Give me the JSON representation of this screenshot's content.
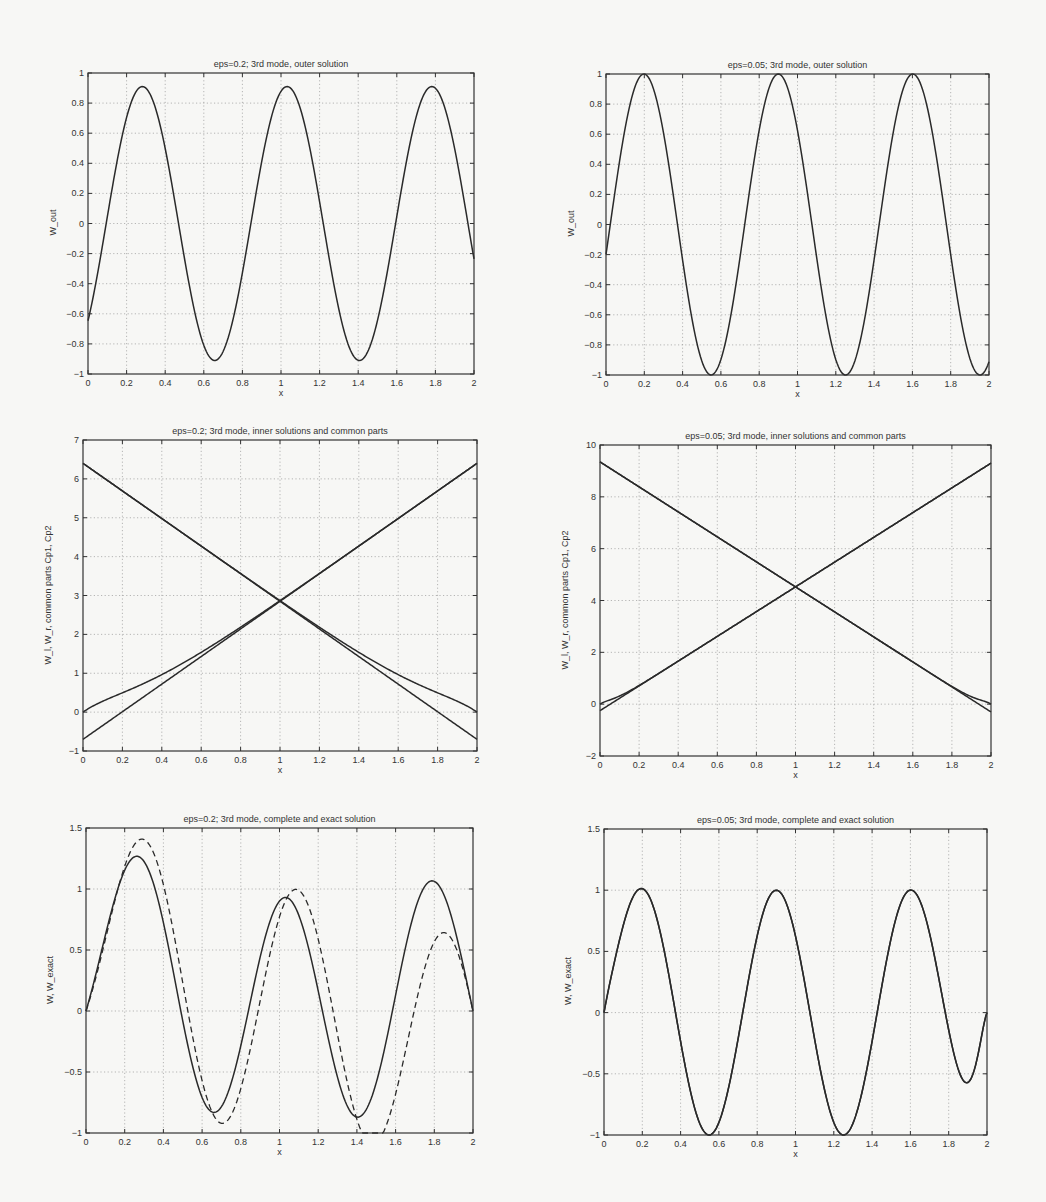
{
  "figure": {
    "panels": [
      {
        "id": "p1",
        "title": "eps=0.2;  3rd mode,  outer solution",
        "xlabel": "x",
        "ylabel": "W_out",
        "box": {
          "left": 88,
          "top": 73,
          "right": 474,
          "bottom": 374
        },
        "xlim": [
          0,
          2
        ],
        "ylim": [
          -1,
          1
        ],
        "xticks": [
          0,
          0.2,
          0.4,
          0.6,
          0.8,
          1,
          1.2,
          1.4,
          1.6,
          1.8,
          2
        ],
        "yticks": [
          -1,
          -0.8,
          -0.6,
          -0.4,
          -0.2,
          0,
          0.2,
          0.4,
          0.6,
          0.8,
          1
        ],
        "series": [
          {
            "name": "W_out",
            "style": "solid",
            "fn": "outer",
            "amp": 0.91,
            "k": 8.38,
            "phase": -0.79
          }
        ]
      },
      {
        "id": "p2",
        "title": "eps=0.05;  3rd mode,  outer solution",
        "xlabel": "x",
        "ylabel": "W_out",
        "box": {
          "left": 606,
          "top": 74,
          "right": 989,
          "bottom": 375
        },
        "xlim": [
          0,
          2
        ],
        "ylim": [
          -1,
          1
        ],
        "xticks": [
          0,
          0.2,
          0.4,
          0.6,
          0.8,
          1,
          1.2,
          1.4,
          1.6,
          1.8,
          2
        ],
        "yticks": [
          -1,
          -0.8,
          -0.6,
          -0.4,
          -0.2,
          0,
          0.2,
          0.4,
          0.6,
          0.8,
          1
        ],
        "series": [
          {
            "name": "W_out",
            "style": "solid",
            "fn": "outer",
            "amp": 1.0,
            "k": 8.95,
            "phase": -0.2
          }
        ]
      },
      {
        "id": "p3",
        "title": "eps=0.2;  3rd mode,  inner solutions and common parts",
        "xlabel": "x",
        "ylabel": "W_l, W_r, common parts Cp1, Cp2",
        "box": {
          "left": 83,
          "top": 440,
          "right": 477,
          "bottom": 751
        },
        "xlim": [
          0,
          2
        ],
        "ylim": [
          -1,
          7
        ],
        "xticks": [
          0,
          0.2,
          0.4,
          0.6,
          0.8,
          1,
          1.2,
          1.4,
          1.6,
          1.8,
          2
        ],
        "yticks": [
          -1,
          0,
          1,
          2,
          3,
          4,
          5,
          6,
          7
        ],
        "series": [
          {
            "name": "Cp1",
            "style": "solid",
            "fn": "line",
            "y0": -0.7,
            "y1": 6.4
          },
          {
            "name": "Cp2",
            "style": "solid",
            "fn": "line",
            "y0": 6.4,
            "y1": -0.7
          },
          {
            "name": "W_l",
            "style": "solid",
            "fn": "innerL",
            "y0": -0.7,
            "y1": 6.4,
            "decay": 0.2
          },
          {
            "name": "W_r",
            "style": "solid",
            "fn": "innerR",
            "y0": 6.4,
            "y1": -0.7,
            "decay": 0.2
          }
        ]
      },
      {
        "id": "p4",
        "title": "eps=0.05;  3rd mode,  inner solutions and common parts",
        "xlabel": "x",
        "ylabel": "W_l, W_r, common parts Cp1, Cp2",
        "box": {
          "left": 600,
          "top": 445,
          "right": 991,
          "bottom": 756
        },
        "xlim": [
          0,
          2
        ],
        "ylim": [
          -2,
          10
        ],
        "xticks": [
          0,
          0.2,
          0.4,
          0.6,
          0.8,
          1,
          1.2,
          1.4,
          1.6,
          1.8,
          2
        ],
        "yticks": [
          -2,
          0,
          2,
          4,
          6,
          8,
          10
        ],
        "series": [
          {
            "name": "Cp1",
            "style": "solid",
            "fn": "line",
            "y0": -0.25,
            "y1": 9.3
          },
          {
            "name": "Cp2",
            "style": "solid",
            "fn": "line",
            "y0": 9.35,
            "y1": -0.3
          },
          {
            "name": "W_l",
            "style": "solid",
            "fn": "innerL",
            "y0": -0.25,
            "y1": 9.3,
            "decay": 0.05
          },
          {
            "name": "W_r",
            "style": "solid",
            "fn": "innerR",
            "y0": 9.35,
            "y1": -0.3,
            "decay": 0.05
          }
        ]
      },
      {
        "id": "p5",
        "title": "eps=0.2;  3rd mode,  complete and exact solution",
        "xlabel": "x",
        "ylabel": "W, W_exact",
        "box": {
          "left": 86,
          "top": 828,
          "right": 473,
          "bottom": 1133
        },
        "xlim": [
          0,
          2
        ],
        "ylim": [
          -1,
          1.5
        ],
        "xticks": [
          0,
          0.2,
          0.4,
          0.6,
          0.8,
          1,
          1.2,
          1.4,
          1.6,
          1.8,
          2
        ],
        "yticks": [
          -1,
          -0.5,
          0,
          0.5,
          1,
          1.5
        ],
        "series": [
          {
            "name": "W",
            "style": "solid",
            "fn": "complete",
            "amp": 0.91,
            "k": 8.38,
            "phase": -0.79,
            "decay": 0.2,
            "peak": 1.0
          },
          {
            "name": "W_exact",
            "style": "dashed",
            "fn": "complete",
            "amp": 1.0,
            "k": 8.1,
            "phase": -0.95,
            "decay": 0.2,
            "peak": 1.03
          }
        ]
      },
      {
        "id": "p6",
        "title": "eps=0.05;  3rd mode,  complete and exact solution",
        "xlabel": "x",
        "ylabel": "W, W_exact",
        "box": {
          "left": 604,
          "top": 829,
          "right": 987,
          "bottom": 1135
        },
        "xlim": [
          0,
          2
        ],
        "ylim": [
          -1,
          1.5
        ],
        "xticks": [
          0,
          0.2,
          0.4,
          0.6,
          0.8,
          1,
          1.2,
          1.4,
          1.6,
          1.8,
          2
        ],
        "yticks": [
          -1,
          -0.5,
          0,
          0.5,
          1,
          1.5
        ],
        "series": [
          {
            "name": "W",
            "style": "solid",
            "fn": "complete",
            "amp": 1.0,
            "k": 8.95,
            "phase": -0.2,
            "decay": 0.05,
            "peak": 1.0
          },
          {
            "name": "W_exact",
            "style": "solid",
            "fn": "complete",
            "amp": 1.0,
            "k": 8.95,
            "phase": -0.2,
            "decay": 0.05,
            "peak": 1.0
          }
        ]
      }
    ]
  },
  "chart_data": [
    {
      "type": "line",
      "title": "eps=0.2;  3rd mode,  outer solution",
      "xlabel": "x",
      "ylabel": "W_out",
      "xlim": [
        0,
        2
      ],
      "ylim": [
        -1,
        1
      ],
      "grid": true,
      "x": [
        0,
        0.2,
        0.43,
        0.6,
        0.8,
        1.0,
        1.2,
        1.4,
        1.57,
        1.8,
        2.0
      ],
      "series": [
        {
          "name": "W_out",
          "values": [
            -0.7,
            0.2,
            0.91,
            0.55,
            -0.45,
            -0.91,
            -0.45,
            0.4,
            0.91,
            0.2,
            -0.7
          ]
        }
      ]
    },
    {
      "type": "line",
      "title": "eps=0.05;  3rd mode,  outer solution",
      "xlabel": "x",
      "ylabel": "W_out",
      "xlim": [
        0,
        2
      ],
      "ylim": [
        -1,
        1
      ],
      "grid": true,
      "x": [
        0,
        0.2,
        0.37,
        0.6,
        0.8,
        1.0,
        1.2,
        1.4,
        1.63,
        1.8,
        2.0
      ],
      "series": [
        {
          "name": "W_out",
          "values": [
            -0.2,
            0.7,
            1.0,
            0.4,
            -0.6,
            -1.0,
            -0.6,
            0.4,
            1.0,
            0.4,
            -0.22
          ]
        }
      ]
    },
    {
      "type": "line",
      "title": "eps=0.2;  3rd mode,  inner solutions and common parts",
      "xlabel": "x",
      "ylabel": "W_l, W_r, common parts Cp1, Cp2",
      "xlim": [
        0,
        2
      ],
      "ylim": [
        -1,
        7
      ],
      "grid": true,
      "x": [
        0,
        0.2,
        0.4,
        0.6,
        0.8,
        1.0,
        1.2,
        1.4,
        1.6,
        1.8,
        2.0
      ],
      "series": [
        {
          "name": "Cp1 (rising line)",
          "values": [
            -0.7,
            0.0,
            0.75,
            1.45,
            2.15,
            2.85,
            3.55,
            4.25,
            4.95,
            5.7,
            6.4
          ]
        },
        {
          "name": "Cp2 (falling line)",
          "values": [
            6.4,
            5.7,
            4.95,
            4.25,
            3.55,
            2.85,
            2.15,
            1.45,
            0.75,
            0.0,
            -0.7
          ]
        },
        {
          "name": "W_l (inner, left)",
          "values": [
            0.0,
            0.25,
            0.8,
            1.5,
            2.17,
            2.87,
            3.55,
            4.25,
            4.95,
            5.7,
            6.4
          ]
        },
        {
          "name": "W_r (inner, right)",
          "values": [
            6.4,
            5.7,
            4.95,
            4.25,
            3.55,
            2.87,
            2.17,
            1.5,
            0.8,
            0.25,
            0.0
          ]
        }
      ]
    },
    {
      "type": "line",
      "title": "eps=0.05;  3rd mode,  inner solutions and common parts",
      "xlabel": "x",
      "ylabel": "W_l, W_r, common parts Cp1, Cp2",
      "xlim": [
        0,
        2
      ],
      "ylim": [
        -2,
        10
      ],
      "grid": true,
      "x": [
        0,
        0.2,
        0.4,
        0.6,
        0.8,
        1.0,
        1.2,
        1.4,
        1.6,
        1.8,
        2.0
      ],
      "series": [
        {
          "name": "Cp1 (rising line)",
          "values": [
            -0.25,
            0.7,
            1.65,
            2.6,
            3.6,
            4.55,
            5.5,
            6.45,
            7.4,
            8.35,
            9.3
          ]
        },
        {
          "name": "Cp2 (falling line)",
          "values": [
            9.35,
            8.4,
            7.45,
            6.5,
            5.5,
            4.55,
            3.6,
            2.65,
            1.7,
            0.7,
            -0.3
          ]
        },
        {
          "name": "W_l (inner, left)",
          "values": [
            0.0,
            0.7,
            1.65,
            2.6,
            3.6,
            4.55,
            5.5,
            6.45,
            7.4,
            8.35,
            9.3
          ]
        },
        {
          "name": "W_r (inner, right)",
          "values": [
            9.35,
            8.4,
            7.45,
            6.5,
            5.5,
            4.55,
            3.6,
            2.65,
            1.7,
            0.7,
            0.0
          ]
        }
      ]
    },
    {
      "type": "line",
      "title": "eps=0.2;  3rd mode,  complete and exact solution",
      "xlabel": "x",
      "ylabel": "W, W_exact",
      "xlim": [
        0,
        2
      ],
      "ylim": [
        -1,
        1.5
      ],
      "grid": true,
      "x": [
        0,
        0.2,
        0.41,
        0.6,
        0.8,
        1.0,
        1.2,
        1.4,
        1.59,
        1.8,
        2.0
      ],
      "series": [
        {
          "name": "W (complete, solid)",
          "values": [
            0.0,
            0.5,
            1.0,
            0.55,
            -0.45,
            -0.9,
            -0.45,
            0.5,
            1.0,
            0.5,
            0.0
          ]
        },
        {
          "name": "W_exact (dashed)",
          "values": [
            0.0,
            0.5,
            1.03,
            0.5,
            -0.55,
            -1.0,
            -0.55,
            0.45,
            1.03,
            0.5,
            0.0
          ]
        }
      ]
    },
    {
      "type": "line",
      "title": "eps=0.05;  3rd mode,  complete and exact solution",
      "xlabel": "x",
      "ylabel": "W, W_exact",
      "xlim": [
        0,
        2
      ],
      "ylim": [
        -1,
        1.5
      ],
      "grid": true,
      "x": [
        0,
        0.2,
        0.37,
        0.6,
        0.8,
        1.0,
        1.2,
        1.4,
        1.63,
        1.8,
        2.0
      ],
      "series": [
        {
          "name": "W (complete)",
          "values": [
            0.0,
            0.7,
            1.0,
            0.4,
            -0.6,
            -1.0,
            -0.6,
            0.4,
            1.0,
            0.55,
            0.0
          ]
        },
        {
          "name": "W_exact (overlaps W)",
          "values": [
            0.0,
            0.7,
            1.0,
            0.4,
            -0.6,
            -1.0,
            -0.6,
            0.4,
            1.0,
            0.55,
            0.0
          ]
        }
      ]
    }
  ]
}
